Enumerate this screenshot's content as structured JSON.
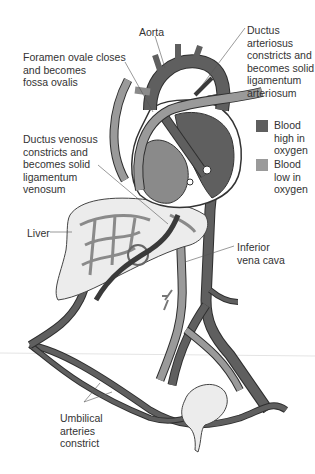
{
  "diagram": {
    "labels": {
      "aorta": "Aorta",
      "foramen_ovale": "Foramen ovale closes\nand becomes\nfossa ovalis",
      "ductus_arteriosus": "Ductus\narteriosus\nconstricts and\nbecomes solid\nligamentum\narteriosum",
      "ductus_venosus": "Ductus venosus\nconstricts and\nbecomes solid\nligamentum\nvenosum",
      "liver": "Liver",
      "inferior_vena_cava": "Inferior\nvena cava",
      "umbilical_arteries": "Umbilical\narteries\nconstrict"
    },
    "legend": [
      {
        "label": "Blood\nhigh in\noxygen",
        "color": "#5f5f5f"
      },
      {
        "label": "Blood\nlow in\noxygen",
        "color": "#9a9a9a"
      }
    ],
    "colors": {
      "high_oxygen": "#5f5f5f",
      "low_oxygen": "#9a9a9a",
      "outline": "#2e2e2e",
      "organ_fill": "#ececec"
    }
  }
}
